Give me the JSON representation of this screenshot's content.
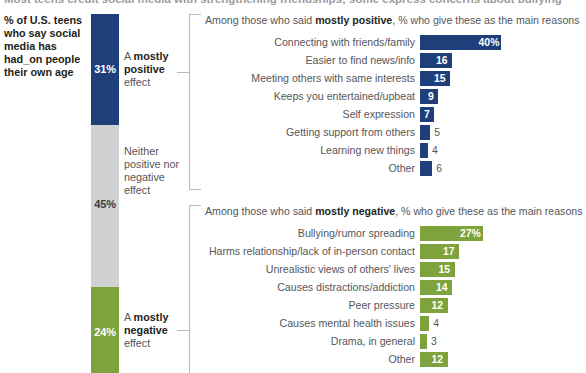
{
  "headline": "Most teens credit social media with strengthening friendships; some express concerns about bullying",
  "question": "% of U.S. teens who say social media has had_on people their own age",
  "colors": {
    "positive": "#1f3f7a",
    "neither": "#cfd1d2",
    "negative": "#7fa33c"
  },
  "stack": {
    "segments": [
      {
        "key": "positive",
        "pct": "31%",
        "label_prefix": "A ",
        "label_bold": "mostly positive",
        "label_suffix": " effect"
      },
      {
        "key": "neither",
        "pct": "45%",
        "label_prefix": "",
        "label_bold": "",
        "label_suffix": "Neither positive nor negative effect"
      },
      {
        "key": "negative",
        "pct": "24%",
        "label_prefix": "A ",
        "label_bold": "mostly negative",
        "label_suffix": " effect"
      }
    ]
  },
  "panels": {
    "positive": {
      "title_pre": "Among those who said ",
      "title_bold": "mostly positive",
      "title_post": ", % who give these as the main reasons"
    },
    "negative": {
      "title_pre": "Among those who said ",
      "title_bold": "mostly negative",
      "title_post": ", % who give these as the main reasons"
    }
  },
  "chart_data": [
    {
      "type": "bar",
      "title": "Among those who said mostly positive, % who give these as the main reasons",
      "orientation": "horizontal",
      "color": "#1f3f7a",
      "xlabel": "",
      "ylabel": "",
      "xlim": [
        0,
        40
      ],
      "grid": false,
      "legend": "none",
      "categories": [
        "Connecting with friends/family",
        "Easier to find news/info",
        "Meeting others with same interests",
        "Keeps you entertained/upbeat",
        "Self expression",
        "Getting support from others",
        "Learning new things",
        "Other"
      ],
      "values": [
        40,
        16,
        15,
        9,
        7,
        5,
        4,
        6
      ],
      "value_labels": [
        "40%",
        "16",
        "15",
        "9",
        "7",
        "5",
        "4",
        "6"
      ]
    },
    {
      "type": "bar",
      "title": "Among those who said mostly negative, % who give these as the main reasons",
      "orientation": "horizontal",
      "color": "#7fa33c",
      "xlabel": "",
      "ylabel": "",
      "xlim": [
        0,
        27
      ],
      "grid": false,
      "legend": "none",
      "categories": [
        "Bullying/rumor spreading",
        "Harms relationship/lack of in-person contact",
        "Unrealistic views of others' lives",
        "Causes distractions/addiction",
        "Peer pressure",
        "Causes mental health issues",
        "Drama, in general",
        "Other"
      ],
      "values": [
        27,
        17,
        15,
        14,
        12,
        4,
        3,
        12
      ],
      "value_labels": [
        "27%",
        "17",
        "15",
        "14",
        "12",
        "4",
        "3",
        "12"
      ]
    },
    {
      "type": "bar",
      "title": "% of U.S. teens who say social media has had_on people their own age",
      "orientation": "stacked-vertical",
      "categories": [
        "A mostly positive effect",
        "Neither positive nor negative effect",
        "A mostly negative effect"
      ],
      "values": [
        31,
        45,
        24
      ],
      "value_labels": [
        "31%",
        "45%",
        "24%"
      ],
      "colors": [
        "#1f3f7a",
        "#cfd1d2",
        "#7fa33c"
      ]
    }
  ]
}
